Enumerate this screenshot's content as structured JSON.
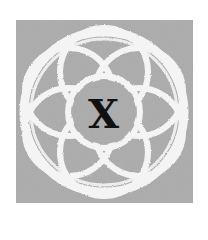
{
  "emblem": {
    "letter": "X",
    "background_color": "#a9a9a9",
    "strand_color": "#f4f4f4",
    "letter_color": "#111111",
    "motif": "interlaced-circular-knot-icon"
  }
}
